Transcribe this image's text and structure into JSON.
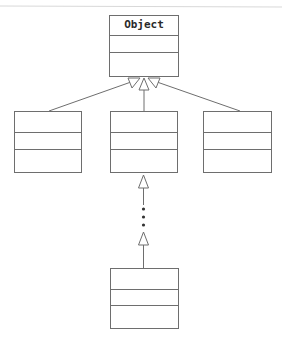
{
  "diagram": {
    "type": "uml-class-inheritance",
    "root_class": {
      "name": "Object"
    },
    "colors": {
      "line": "#6e6e6e",
      "text": "#2a2a2a",
      "background": "#ffffff"
    },
    "classes": [
      {
        "id": "object",
        "name": "Object",
        "x": 109,
        "y": 15,
        "w": 70,
        "h": 62,
        "dividers": [
          19,
          36
        ]
      },
      {
        "id": "child-left",
        "name": "",
        "x": 14,
        "y": 111,
        "w": 68,
        "h": 62,
        "dividers": [
          20,
          37
        ]
      },
      {
        "id": "child-middle",
        "name": "",
        "x": 110,
        "y": 111,
        "w": 68,
        "h": 62,
        "dividers": [
          20,
          37
        ]
      },
      {
        "id": "child-right",
        "name": "",
        "x": 203,
        "y": 111,
        "w": 69,
        "h": 62,
        "dividers": [
          20,
          37
        ]
      },
      {
        "id": "descendant-bottom",
        "name": "",
        "x": 110,
        "y": 268,
        "w": 69,
        "h": 61,
        "dividers": [
          20,
          36
        ]
      }
    ],
    "relationships": [
      {
        "from": "child-left",
        "to": "object",
        "kind": "generalization"
      },
      {
        "from": "child-middle",
        "to": "object",
        "kind": "generalization"
      },
      {
        "from": "child-right",
        "to": "object",
        "kind": "generalization"
      },
      {
        "from": "descendant-bottom",
        "to": "child-middle",
        "kind": "generalization",
        "elided_levels": "..."
      }
    ]
  }
}
